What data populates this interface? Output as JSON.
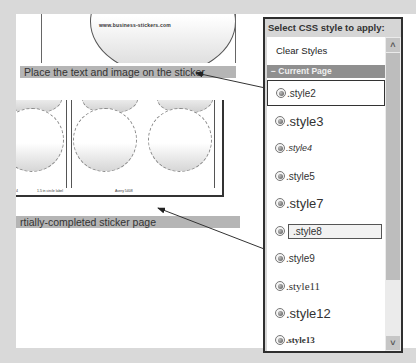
{
  "document": {
    "sheet_url_text": "www.business-stickers.com",
    "caption_top": "Place the text and image on the sticker",
    "caption_bottom": "rtially-completed sticker page",
    "sheet_labels": [
      "4",
      "1.5 in circle label",
      "Avery 5408"
    ]
  },
  "panel": {
    "title": "Select CSS style to apply:",
    "clear_styles_label": "Clear Styles",
    "group_header": "− Current Page",
    "items": [
      {
        "label": ".style2",
        "selected": true,
        "font_size": 10
      },
      {
        "label": ".style3",
        "font_size": 13
      },
      {
        "label": ".style4",
        "font_size": 9,
        "italic": true
      },
      {
        "label": ".style5",
        "font_size": 10
      },
      {
        "label": ".style7",
        "font_size": 13
      },
      {
        "label": ".style8",
        "font_size": 10,
        "boxed": true
      },
      {
        "label": ".style9",
        "font_size": 10
      },
      {
        "label": ".style11",
        "font_size": 11,
        "serif": true
      },
      {
        "label": ".style12",
        "font_size": 13
      },
      {
        "label": ".style13",
        "font_size": 9,
        "serif": true,
        "bold": true
      }
    ],
    "scroll_up_glyph": "˄",
    "scroll_down_glyph": "˅"
  }
}
